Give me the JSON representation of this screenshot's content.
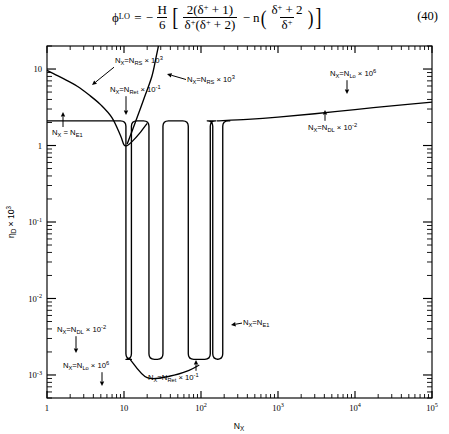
{
  "equation": {
    "lhs_symbol": "ϕ",
    "lhs_subscript": "LO",
    "equals": "=",
    "minus": "−",
    "prefactor_num": "H",
    "prefactor_den": "6",
    "bracket_open": "[",
    "bracket_close": "]",
    "term1_num": "2(δ",
    "term1_num_sup": "+",
    "term1_num_tail": " + 1)",
    "term1_den_a": "δ",
    "term1_den_a_sup": "+",
    "term1_den_b": "(δ",
    "term1_den_b_sup": "+",
    "term1_den_tail": " + 2)",
    "operator": "−",
    "log_symbol": "n",
    "paren_open": "(",
    "paren_close": ")",
    "term2_num": "δ",
    "term2_num_sup": "+",
    "term2_num_tail": " + 2",
    "term2_den": "δ",
    "term2_den_sup": "+",
    "number": "(40)"
  },
  "chart_data": {
    "type": "line",
    "title": "",
    "xlabel": "N_X",
    "ylabel": "η_D × 10³",
    "xscale": "log",
    "yscale": "log",
    "xlim": [
      1,
      100000
    ],
    "ylim": [
      0.0005,
      20
    ],
    "grid": false,
    "legend": "none",
    "x_ticks": [
      {
        "value": 1,
        "label": "1",
        "sup": ""
      },
      {
        "value": 10,
        "label": "10",
        "sup": ""
      },
      {
        "value": 100,
        "label": "10",
        "sup": "2"
      },
      {
        "value": 1000,
        "label": "10",
        "sup": "3"
      },
      {
        "value": 10000,
        "label": "10",
        "sup": "4"
      },
      {
        "value": 100000,
        "label": "10",
        "sup": "5"
      }
    ],
    "y_ticks": [
      {
        "value": 10,
        "label": "10",
        "sup": ""
      },
      {
        "value": 1,
        "label": "1",
        "sup": ""
      },
      {
        "value": 0.1,
        "label": "10",
        "sup": "-1"
      },
      {
        "value": 0.01,
        "label": "10",
        "sup": "-2"
      },
      {
        "value": 0.001,
        "label": "10",
        "sup": "-3"
      }
    ],
    "series": [
      {
        "name": "decaying-branch",
        "description": "Curve descending from 10 at N_X=1 to a minimum near 1 at N_X=10, then rising",
        "points": [
          [
            1,
            9.6
          ],
          [
            1.3,
            8.4
          ],
          [
            1.8,
            7.1
          ],
          [
            2.5,
            5.9
          ],
          [
            3.5,
            4.6
          ],
          [
            5,
            3.4
          ],
          [
            7,
            2.3
          ],
          [
            9,
            1.35
          ],
          [
            10,
            1.02
          ],
          [
            11,
            1.0
          ],
          [
            13,
            1.15
          ],
          [
            16,
            1.45
          ],
          [
            20,
            1.95
          ]
        ]
      },
      {
        "name": "steep-rising-branch",
        "description": "Steep line rising off-scale between N_X=10 and N_X=30",
        "points": [
          [
            11,
            1.05
          ],
          [
            14,
            2.0
          ],
          [
            18,
            4.0
          ],
          [
            23,
            8.0
          ],
          [
            26,
            14
          ],
          [
            28,
            20
          ]
        ]
      },
      {
        "name": "plateau-with-notches",
        "description": "Horizontal plateau at eta=2.1 interrupted by four near-vertical drops to ~1e-3",
        "plateau_value": 2.1,
        "notch_x": [
          11.5,
          26,
          95,
          165
        ],
        "notch_bottom": 0.0016
      },
      {
        "name": "upper-rising-tail",
        "description": "Gentle rise from plateau level 2.1 at N_X=200 to 3.6 at N_X=1e5",
        "points": [
          [
            160,
            2.1
          ],
          [
            400,
            2.2
          ],
          [
            1000,
            2.35
          ],
          [
            3000,
            2.6
          ],
          [
            10000,
            2.95
          ],
          [
            30000,
            3.3
          ],
          [
            100000,
            3.7
          ]
        ]
      },
      {
        "name": "lower-rising-tail",
        "description": "Lower branch rising from 9e-4 near N_X=12 toward 1.6e-3",
        "points": [
          [
            12,
            0.0016
          ],
          [
            20,
            0.00092
          ],
          [
            40,
            0.00097
          ],
          [
            70,
            0.00115
          ],
          [
            95,
            0.00135
          ]
        ]
      }
    ],
    "annotations": [
      {
        "id": "ann-nrs-upper",
        "text_prefix": "N",
        "text_sub1": "X",
        "text_mid": "=N",
        "text_sub2": "RS",
        "text_tail": " × 10",
        "text_sup": "3",
        "x_px": 115,
        "y_px": 25,
        "arrow_to": [
          92,
          47
        ]
      },
      {
        "id": "ann-nrs-right",
        "text_prefix": "N",
        "text_sub1": "X",
        "text_mid": "=N",
        "text_sub2": "RS",
        "text_tail": " × 10",
        "text_sup": "3",
        "x_px": 187,
        "y_px": 44,
        "arrow_to": [
          167,
          36
        ]
      },
      {
        "id": "ann-nret-upper",
        "text_prefix": "N",
        "text_sub1": "X",
        "text_mid": "=N",
        "text_sub2": "Ret",
        "text_tail": " × 10",
        "text_sup": "-1",
        "x_px": 110,
        "y_px": 54,
        "arrow_to": [
          126,
          77
        ]
      },
      {
        "id": "ann-nlo-upper",
        "text_prefix": "N",
        "text_sub1": "X",
        "text_mid": "=N",
        "text_sub2": "Lo",
        "text_tail": " × 10",
        "text_sup": "6",
        "x_px": 330,
        "y_px": 38,
        "arrow_to": [
          347,
          56
        ]
      },
      {
        "id": "ann-ndl-right",
        "text_prefix": "N",
        "text_sub1": "X",
        "text_mid": "=N",
        "text_sub2": "DL",
        "text_tail": " × 10",
        "text_sup": "-2",
        "x_px": 308,
        "y_px": 92,
        "arrow_to": [
          325,
          72
        ]
      },
      {
        "id": "ann-ne1-left",
        "text_prefix": "N",
        "text_sub1": "X",
        "text_mid": " = N",
        "text_sub2": "E1",
        "text_tail": "",
        "text_sup": "",
        "x_px": 52,
        "y_px": 97,
        "arrow_to": [
          63,
          74
        ]
      },
      {
        "id": "ann-ndl-lower",
        "text_prefix": "N",
        "text_sub1": "X",
        "text_mid": "=N",
        "text_sub2": "DL",
        "text_tail": " × 10",
        "text_sup": "-2",
        "x_px": 57,
        "y_px": 294,
        "arrow_to": [
          76,
          315
        ]
      },
      {
        "id": "ann-nlo-lower",
        "text_prefix": "N",
        "text_sub1": "X",
        "text_mid": "=N",
        "text_sub2": "Lo",
        "text_tail": " × 10",
        "text_sup": "6",
        "x_px": 63,
        "y_px": 330,
        "arrow_to": [
          102,
          348
        ]
      },
      {
        "id": "ann-nret-lower",
        "text_prefix": "N",
        "text_sub1": "X",
        "text_mid": "=N",
        "text_sub2": "Ret",
        "text_tail": " × 10",
        "text_sup": "-1",
        "x_px": 148,
        "y_px": 342,
        "arrow_to": [
          196,
          322
        ]
      },
      {
        "id": "ann-ne1-right",
        "text_prefix": "N",
        "text_sub1": "X",
        "text_mid": "=N",
        "text_sub2": "E1",
        "text_tail": "",
        "text_sup": "",
        "x_px": 243,
        "y_px": 287,
        "arrow_to": [
          231,
          287
        ]
      }
    ]
  }
}
